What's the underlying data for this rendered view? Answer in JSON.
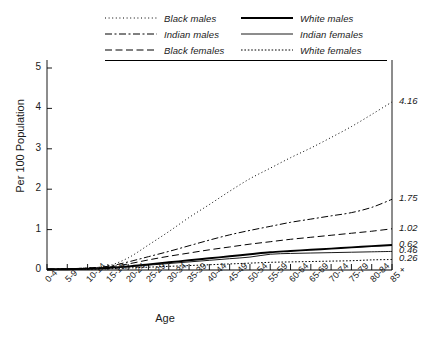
{
  "chart_data": {
    "type": "line",
    "title": "",
    "xlabel": "Age",
    "ylabel": "Per 100 Population",
    "ylim": [
      0,
      5
    ],
    "yticks": [
      "0",
      "1",
      "2",
      "3",
      "4",
      "5"
    ],
    "grid": false,
    "legend_position": "top",
    "categories": [
      "0-4",
      "5-9",
      "10-14",
      "15-19",
      "20-24",
      "25-29",
      "30-34",
      "35-39",
      "40-44",
      "45-49",
      "50-54",
      "55-59",
      "60-64",
      "65-69",
      "70-74",
      "75-79",
      "80-84",
      "85 +"
    ],
    "series": [
      {
        "name": "Black males",
        "style": "dotted",
        "end_label": "4.16",
        "values": [
          0.02,
          0.03,
          0.05,
          0.1,
          0.3,
          0.62,
          0.95,
          1.3,
          1.62,
          1.95,
          2.26,
          2.52,
          2.78,
          3.02,
          3.28,
          3.55,
          3.85,
          4.16
        ]
      },
      {
        "name": "Indian males",
        "style": "dash-dot",
        "end_label": "1.75",
        "values": [
          0.02,
          0.03,
          0.05,
          0.09,
          0.2,
          0.33,
          0.46,
          0.6,
          0.74,
          0.87,
          0.98,
          1.08,
          1.18,
          1.26,
          1.34,
          1.42,
          1.55,
          1.75
        ]
      },
      {
        "name": "Black females",
        "style": "dashed",
        "end_label": "1.02",
        "values": [
          0.02,
          0.03,
          0.04,
          0.07,
          0.15,
          0.25,
          0.34,
          0.42,
          0.5,
          0.57,
          0.64,
          0.7,
          0.76,
          0.81,
          0.86,
          0.91,
          0.96,
          1.02
        ]
      },
      {
        "name": "White males",
        "style": "solid-thick",
        "end_label": "0.62",
        "values": [
          0.02,
          0.02,
          0.03,
          0.05,
          0.09,
          0.14,
          0.19,
          0.24,
          0.29,
          0.34,
          0.39,
          0.44,
          0.47,
          0.5,
          0.53,
          0.56,
          0.59,
          0.62
        ]
      },
      {
        "name": "Indian females",
        "style": "solid-thin",
        "end_label": "0.46",
        "values": [
          0.02,
          0.02,
          0.03,
          0.05,
          0.08,
          0.12,
          0.16,
          0.2,
          0.24,
          0.28,
          0.32,
          0.39,
          0.41,
          0.42,
          0.43,
          0.44,
          0.45,
          0.46
        ]
      },
      {
        "name": "White females",
        "style": "fine-dotted",
        "end_label": "0.26",
        "values": [
          0.01,
          0.02,
          0.02,
          0.03,
          0.05,
          0.07,
          0.09,
          0.11,
          0.13,
          0.15,
          0.17,
          0.19,
          0.2,
          0.21,
          0.22,
          0.23,
          0.25,
          0.26
        ]
      }
    ],
    "end_labels": [
      "4.16",
      "1.75",
      "1.02",
      "0.62",
      "0.46",
      "0.26"
    ],
    "colors": {
      "line": "#000000",
      "axis": "#000000",
      "background": "#ffffff"
    }
  },
  "legend": {
    "left_column": [
      {
        "label": "Black males",
        "style": "dotted"
      },
      {
        "label": "Indian males",
        "style": "dash-dot"
      },
      {
        "label": "Black females",
        "style": "dashed"
      }
    ],
    "right_column": [
      {
        "label": "White males",
        "style": "solid-thick"
      },
      {
        "label": "Indian females",
        "style": "solid-thin"
      },
      {
        "label": "White females",
        "style": "fine-dotted"
      }
    ]
  }
}
